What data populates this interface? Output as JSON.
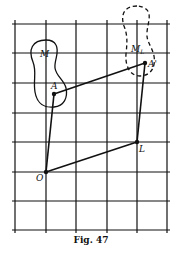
{
  "figure": {
    "caption": "Fig. 47",
    "grid": {
      "vertical_x": [
        15,
        46,
        76,
        107,
        137,
        167
      ],
      "horizontal_y": [
        24,
        53,
        83,
        113,
        142,
        172,
        201,
        230
      ],
      "x_range": [
        13,
        169
      ],
      "y_range": [
        20,
        233
      ]
    },
    "points": {
      "O": {
        "label": "O",
        "x": 46,
        "y": 172
      },
      "A": {
        "label": "A",
        "x": 54,
        "y": 94
      },
      "L": {
        "label": "L",
        "x": 137,
        "y": 142
      },
      "A_prime": {
        "label": "A'",
        "x": 145,
        "y": 63
      }
    },
    "regions": {
      "M": {
        "label": "M",
        "style": "solid"
      },
      "M_L": {
        "label": "M",
        "subscript": "L",
        "style": "dashed"
      }
    },
    "segments": [
      [
        "O",
        "A"
      ],
      [
        "A",
        "A_prime"
      ],
      [
        "A_prime",
        "L"
      ],
      [
        "L",
        "O"
      ]
    ],
    "colors": {
      "ink": "#111111",
      "background": "#ffffff"
    }
  }
}
